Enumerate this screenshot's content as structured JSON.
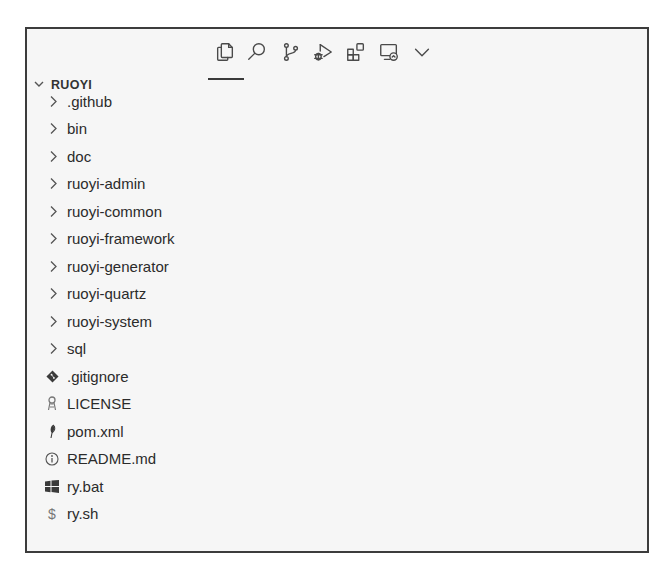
{
  "activity_bar": {
    "items": [
      {
        "name": "explorer",
        "icon": "files-icon",
        "active": true
      },
      {
        "name": "search",
        "icon": "search-icon",
        "active": false
      },
      {
        "name": "source-control",
        "icon": "source-control-icon",
        "active": false
      },
      {
        "name": "run-and-debug",
        "icon": "run-debug-icon",
        "active": false
      },
      {
        "name": "extensions",
        "icon": "extensions-icon",
        "active": false
      },
      {
        "name": "remote-explorer",
        "icon": "remote-explorer-icon",
        "active": false
      },
      {
        "name": "more",
        "icon": "chevron-down-icon",
        "active": false
      }
    ]
  },
  "explorer": {
    "root_label": "RUOYI",
    "items": [
      {
        "label": ".github",
        "type": "folder"
      },
      {
        "label": "bin",
        "type": "folder"
      },
      {
        "label": "doc",
        "type": "folder"
      },
      {
        "label": "ruoyi-admin",
        "type": "folder"
      },
      {
        "label": "ruoyi-common",
        "type": "folder"
      },
      {
        "label": "ruoyi-framework",
        "type": "folder"
      },
      {
        "label": "ruoyi-generator",
        "type": "folder"
      },
      {
        "label": "ruoyi-quartz",
        "type": "folder"
      },
      {
        "label": "ruoyi-system",
        "type": "folder"
      },
      {
        "label": "sql",
        "type": "folder"
      },
      {
        "label": ".gitignore",
        "type": "file",
        "icon": "git-icon"
      },
      {
        "label": "LICENSE",
        "type": "file",
        "icon": "license-icon"
      },
      {
        "label": "pom.xml",
        "type": "file",
        "icon": "maven-feather-icon"
      },
      {
        "label": "README.md",
        "type": "file",
        "icon": "info-icon"
      },
      {
        "label": "ry.bat",
        "type": "file",
        "icon": "windows-icon"
      },
      {
        "label": "ry.sh",
        "type": "file",
        "icon": "dollar-icon",
        "glyph": "$"
      }
    ]
  }
}
